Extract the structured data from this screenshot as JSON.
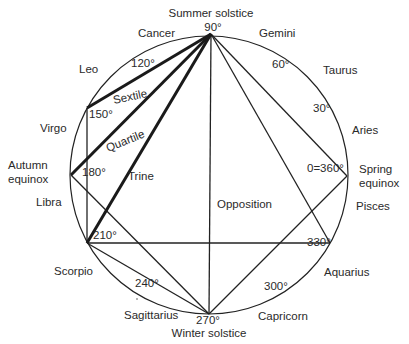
{
  "diagram": {
    "circle": {
      "cx": 209,
      "cy": 175,
      "r": 139
    },
    "points": {
      "p0": {
        "label": "0=360°",
        "x": 347,
        "y": 176
      },
      "p90": {
        "label": "90°",
        "x": 211,
        "y": 34
      },
      "p150": {
        "label": "150°",
        "x": 87,
        "y": 108
      },
      "p180": {
        "label": "180°",
        "x": 71,
        "y": 175
      },
      "p210": {
        "label": "210°",
        "x": 87,
        "y": 243
      },
      "p270": {
        "label": "270°",
        "x": 209,
        "y": 314
      },
      "p330": {
        "label": "330°",
        "x": 330,
        "y": 243
      }
    },
    "degree_labels": {
      "d30": "30°",
      "d60": "60°",
      "d90": "90°",
      "d120": "120°",
      "d150": "150°",
      "d180": "180°",
      "d210": "210°",
      "d240": "240°",
      "d270": "270°",
      "d300": "300°",
      "d330": "330°",
      "d0": "0=360°"
    },
    "seasons": {
      "summer": "Summer solstice",
      "winter": "Winter solstice",
      "autumn_line1": "Autumn",
      "autumn_line2": "equinox",
      "spring_line1": "Spring",
      "spring_line2": "equinox"
    },
    "signs": {
      "aries": "Aries",
      "taurus": "Taurus",
      "gemini": "Gemini",
      "cancer": "Cancer",
      "leo": "Leo",
      "virgo": "Virgo",
      "libra": "Libra",
      "scorpio": "Scorpio",
      "sagittarius": "Sagittarius",
      "capricorn": "Capricorn",
      "aquarius": "Aquarius",
      "pisces": "Pisces"
    },
    "aspects": {
      "sextile": "Sextile",
      "quartile": "Quartile",
      "trine": "Trine",
      "opposition": "Opposition"
    },
    "lines": [
      {
        "from": "p90",
        "to": "p150",
        "weight": "thick",
        "aspect": "Sextile"
      },
      {
        "from": "p90",
        "to": "p180",
        "weight": "thick",
        "aspect": "Quartile"
      },
      {
        "from": "p90",
        "to": "p210",
        "weight": "thick",
        "aspect": "Trine"
      },
      {
        "from": "p90",
        "to": "p270",
        "weight": "thin",
        "aspect": "Opposition"
      },
      {
        "from": "p90",
        "to": "p0",
        "weight": "thin"
      },
      {
        "from": "p90",
        "to": "p330",
        "weight": "thin"
      },
      {
        "from": "p150",
        "to": "p210",
        "weight": "thin"
      },
      {
        "from": "p180",
        "to": "p270",
        "weight": "thin"
      },
      {
        "from": "p210",
        "to": "p270",
        "weight": "thin"
      },
      {
        "from": "p210",
        "to": "p330",
        "weight": "thin"
      },
      {
        "from": "p270",
        "to": "p0",
        "weight": "thin"
      }
    ],
    "colors": {
      "line": "#222222",
      "text": "#2a2a2a",
      "background": "#ffffff"
    }
  }
}
